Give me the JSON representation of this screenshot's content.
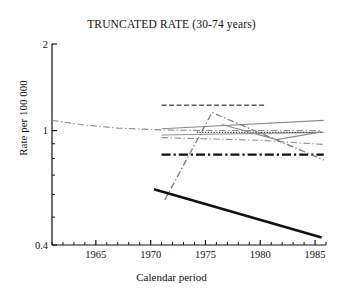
{
  "chart_data": {
    "type": "line",
    "title": "TRUNCATED RATE (30-74 years)",
    "xlabel": "Calendar period",
    "ylabel": "Rate per 100 000",
    "yscale": "log",
    "ylim": [
      0.4,
      2
    ],
    "xlim": [
      1961,
      1986
    ],
    "ytick_labels": [
      "2",
      "1",
      "0.4"
    ],
    "ytick_values": [
      2,
      1,
      0.4
    ],
    "xtick_labels": [
      "1965",
      "1970",
      "1975",
      "1980",
      "1985"
    ],
    "xtick_values": [
      1965,
      1970,
      1975,
      1980,
      1985
    ],
    "xminor_step": 1,
    "grid": false,
    "legend": "none",
    "series": [
      {
        "name": "long-term-declining-dashdot",
        "style": "dashdot",
        "color": "#8c8c8c",
        "width": 1.1,
        "x": [
          1961.0,
          1964.0,
          1967.0,
          1971.0,
          1975.0,
          1980.0,
          1985.6
        ],
        "y": [
          1.085,
          1.045,
          1.02,
          1.005,
          1.0,
          1.0,
          1.0
        ]
      },
      {
        "name": "top-dashed-flat",
        "style": "dashed",
        "color": "#5a5a5a",
        "width": 1.5,
        "x": [
          1971.0,
          1980.4
        ],
        "y": [
          1.225,
          1.225
        ]
      },
      {
        "name": "upper-solid-rising",
        "style": "solid",
        "color": "#8c8c8c",
        "width": 1.1,
        "x": [
          1971.0,
          1985.8
        ],
        "y": [
          1.015,
          1.085
        ]
      },
      {
        "name": "mid-solid-flat-grey",
        "style": "solid",
        "color": "#949494",
        "width": 1.2,
        "x": [
          1971.0,
          1985.8
        ],
        "y": [
          0.965,
          0.985
        ]
      },
      {
        "name": "mid-dotted-flat",
        "style": "dotted",
        "color": "#333333",
        "width": 1.2,
        "x": [
          1974.2,
          1985.6
        ],
        "y": [
          0.985,
          0.985
        ]
      },
      {
        "name": "lower-dashdot-declining",
        "style": "dashdot",
        "color": "#8c8c8c",
        "width": 1.1,
        "x": [
          1971.0,
          1980.0,
          1985.8
        ],
        "y": [
          0.945,
          0.925,
          0.895
        ]
      },
      {
        "name": "v-shaped-solid",
        "style": "solid",
        "color": "#8c8c8c",
        "width": 1.2,
        "x": [
          1976.5,
          1981.5,
          1985.6
        ],
        "y": [
          1.05,
          0.93,
          0.99
        ]
      },
      {
        "name": "thick-dashdot-flat",
        "style": "dashdot",
        "color": "#111111",
        "width": 2.4,
        "x": [
          1971.0,
          1985.8
        ],
        "y": [
          0.825,
          0.825
        ]
      },
      {
        "name": "steep-rising-falling-dashdot",
        "style": "dashdot",
        "color": "#7a7a7a",
        "width": 1.3,
        "x": [
          1971.3,
          1975.6,
          1985.8
        ],
        "y": [
          0.575,
          1.155,
          0.79
        ]
      },
      {
        "name": "thick-black-declining",
        "style": "solid",
        "color": "#111111",
        "width": 2.6,
        "x": [
          1970.3,
          1985.6
        ],
        "y": [
          0.625,
          0.425
        ]
      }
    ]
  },
  "axes": {
    "plot_left": 52,
    "plot_right": 326,
    "plot_top": 44,
    "plot_bottom": 245
  }
}
